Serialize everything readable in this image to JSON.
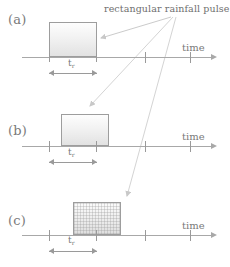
{
  "figure": {
    "callout": {
      "text": "rectangular rainfall pulse",
      "x": 104,
      "y": 3
    },
    "panels": [
      {
        "id": "a",
        "label": "(a)",
        "label_x": 8,
        "label_y": 12,
        "axis": {
          "x": 22,
          "y": 57,
          "width": 190,
          "arrow_x": 212
        },
        "time_label": "time",
        "time_label_x": 182,
        "time_label_y": 44,
        "ticks": [
          {
            "x": 49,
            "top": 53,
            "height": 9
          },
          {
            "x": 97,
            "top": 53,
            "height": 9
          },
          {
            "x": 145,
            "top": 52,
            "height": 11
          },
          {
            "x": 190,
            "top": 52,
            "height": 11
          }
        ],
        "pulse": {
          "x": 49,
          "y": 22,
          "width": 48,
          "height": 35,
          "hatched": false
        },
        "duration": {
          "label": "t",
          "subscript": "r",
          "label_x": 68,
          "label_y": 59,
          "line_y": 73,
          "line_x": 49,
          "line_width": 48
        }
      },
      {
        "id": "b",
        "label": "(b)",
        "label_x": 8,
        "label_y": 36,
        "axis": {
          "x": 22,
          "y": 57,
          "width": 190,
          "arrow_x": 212
        },
        "time_label": "time",
        "time_label_x": 182,
        "time_label_y": 44,
        "ticks": [
          {
            "x": 49,
            "top": 52,
            "height": 11
          },
          {
            "x": 97,
            "top": 52,
            "height": 11
          },
          {
            "x": 145,
            "top": 52,
            "height": 11
          },
          {
            "x": 190,
            "top": 52,
            "height": 11
          }
        ],
        "pulse": {
          "x": 61,
          "y": 25,
          "width": 48,
          "height": 32,
          "hatched": false
        },
        "duration": {
          "label": "t",
          "subscript": "r",
          "label_x": 68,
          "label_y": 59,
          "line_y": 73,
          "line_x": 49,
          "line_width": 48
        }
      },
      {
        "id": "c",
        "label": "(c)",
        "label_x": 8,
        "label_y": 37,
        "axis": {
          "x": 22,
          "y": 57,
          "width": 190,
          "arrow_x": 212
        },
        "time_label": "time",
        "time_label_x": 182,
        "time_label_y": 44,
        "ticks": [
          {
            "x": 49,
            "top": 52,
            "height": 11
          },
          {
            "x": 97,
            "top": 52,
            "height": 11
          },
          {
            "x": 145,
            "top": 52,
            "height": 11
          },
          {
            "x": 190,
            "top": 52,
            "height": 11
          }
        ],
        "pulse": {
          "x": 73,
          "y": 24,
          "width": 48,
          "height": 33,
          "hatched": true
        },
        "duration": {
          "label": "t",
          "subscript": "r",
          "label_x": 68,
          "label_y": 58,
          "line_y": 73,
          "line_x": 49,
          "line_width": 48
        }
      }
    ],
    "leaders": [
      {
        "name": "leader-to-panel-a",
        "x1": 171,
        "y1": 17,
        "x2": 99,
        "y2": 38
      },
      {
        "name": "leader-to-panel-b",
        "x1": 173,
        "y1": 17,
        "x2": 88,
        "y2": 107
      },
      {
        "name": "leader-to-panel-c",
        "x1": 175,
        "y1": 17,
        "x2": 125,
        "y2": 197
      }
    ],
    "colors": {
      "line": "#a8a8a8",
      "text": "#6e6e6e",
      "box_border": "#9d9d9d",
      "leader": "#c8c8c8"
    }
  }
}
